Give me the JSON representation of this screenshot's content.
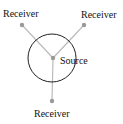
{
  "diagram": {
    "source": {
      "label": "Source",
      "x": 53,
      "y": 58
    },
    "range_circle": {
      "cx": 52,
      "cy": 58,
      "r": 24
    },
    "receivers": [
      {
        "label": "Receiver",
        "x": 22,
        "y": 25,
        "label_x": 3,
        "label_y": 17
      },
      {
        "label": "Receiver",
        "x": 84,
        "y": 25,
        "label_x": 81,
        "label_y": 18
      },
      {
        "label": "Receiver",
        "x": 52,
        "y": 101,
        "label_x": 34,
        "label_y": 117
      }
    ],
    "colors": {
      "circle": "#222222",
      "link": "#bbbbbb",
      "node": "#999999",
      "text": "#111111"
    }
  }
}
